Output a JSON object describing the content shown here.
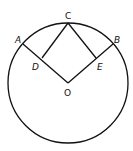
{
  "diagram": {
    "type": "geometry",
    "colors": {
      "stroke": "#111111",
      "background": "#ffffff"
    },
    "circle": {
      "center": "O",
      "cx": 68,
      "cy": 83,
      "r": 60
    },
    "points": {
      "A": {
        "label": "A",
        "x": 23,
        "y": 44
      },
      "B": {
        "label": "B",
        "x": 113,
        "y": 44
      },
      "C": {
        "label": "C",
        "x": 68,
        "y": 23
      },
      "D": {
        "label": "D",
        "x": 42,
        "y": 58
      },
      "E": {
        "label": "E",
        "x": 96,
        "y": 58
      },
      "O": {
        "label": "O",
        "x": 68,
        "y": 83
      }
    },
    "segments": [
      "OA",
      "OB",
      "CD",
      "CE"
    ]
  }
}
